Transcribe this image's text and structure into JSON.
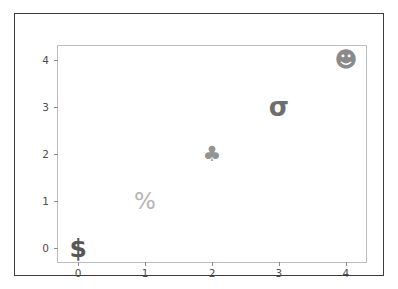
{
  "chart_data": {
    "type": "scatter",
    "title": "",
    "xlabel": "",
    "ylabel": "",
    "xlim": [
      -0.3,
      4.3
    ],
    "ylim": [
      -0.3,
      4.3
    ],
    "xticks": [
      0,
      1,
      2,
      3,
      4
    ],
    "yticks": [
      0,
      1,
      2,
      3,
      4
    ],
    "xticklabels": [
      "0",
      "1",
      "2",
      "3",
      "4"
    ],
    "yticklabels": [
      "0",
      "1",
      "2",
      "3",
      "4"
    ],
    "grid": false,
    "legend": false,
    "x": [
      0,
      1,
      2,
      3,
      4
    ],
    "y": [
      0,
      1,
      2,
      3,
      4
    ],
    "points": [
      {
        "x": 0,
        "y": 0,
        "marker_glyph": "$",
        "marker_name": "dollar-sign-marker",
        "color": "#575757",
        "size": 25,
        "weight": "bold"
      },
      {
        "x": 1,
        "y": 1,
        "marker_glyph": "%",
        "marker_name": "percent-sign-marker",
        "color": "#b4b4b4",
        "size": 23,
        "weight": "normal"
      },
      {
        "x": 2,
        "y": 2,
        "marker_glyph": "♣",
        "marker_name": "club-suit-marker",
        "color": "#949494",
        "size": 21,
        "weight": "normal"
      },
      {
        "x": 3,
        "y": 3,
        "marker_glyph": "σ",
        "marker_name": "sigma-marker",
        "color": "#6e6e6e",
        "size": 26,
        "weight": "bold"
      },
      {
        "x": 4,
        "y": 4,
        "marker_glyph": "☻",
        "marker_name": "smiley-face-marker",
        "color": "#8a8a8a",
        "size": 22,
        "weight": "normal"
      }
    ],
    "colors": {
      "figure_frame": "#3b3b3b",
      "axes_spine": "#bcbcbc",
      "tick": "#8a8a8a",
      "ticklabel": "#4d4d4d",
      "background": "#ffffff"
    }
  }
}
